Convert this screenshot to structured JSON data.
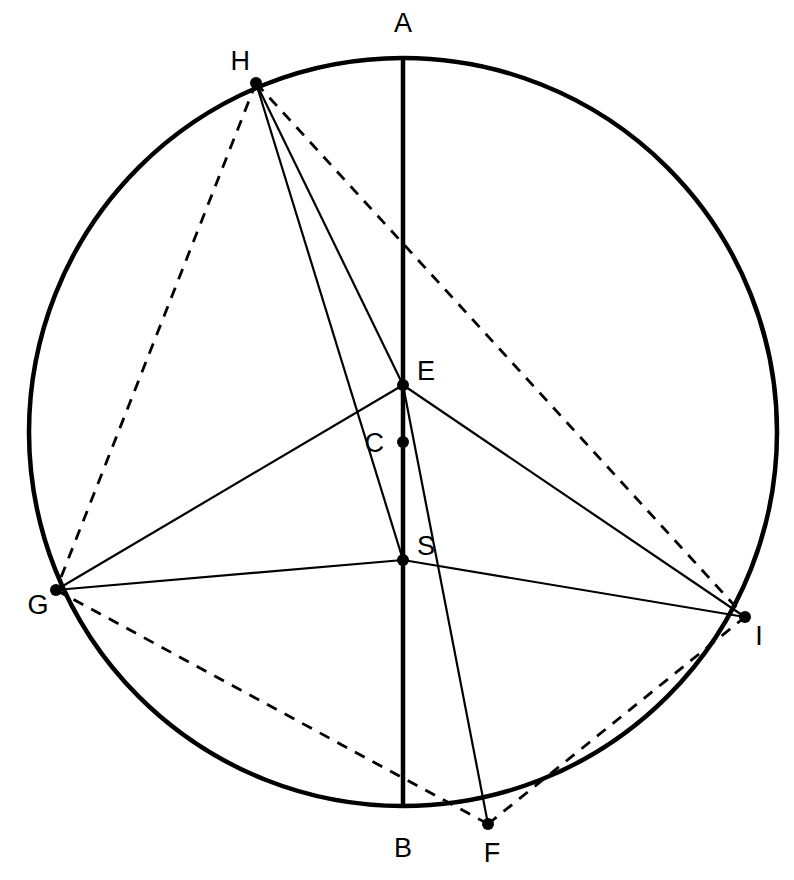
{
  "figure": {
    "background_color": "#ffffff",
    "stroke_color": "#000000",
    "width": 794,
    "height": 880
  },
  "circle": {
    "name": "main-circle",
    "center": {
      "x": 403,
      "y": 432
    },
    "radius": 374,
    "stroke_width": 4.5
  },
  "points": [
    {
      "id": "A",
      "label": "A",
      "x": 403,
      "y": 58,
      "label_x": 403,
      "label_y": 32,
      "dot": false,
      "anchor": "middle"
    },
    {
      "id": "B",
      "label": "B",
      "x": 403,
      "y": 806,
      "label_x": 403,
      "label_y": 857,
      "dot": false,
      "anchor": "middle"
    },
    {
      "id": "C",
      "label": "C",
      "x": 403,
      "y": 442,
      "label_x": 384,
      "label_y": 452,
      "dot": true,
      "anchor": "end"
    },
    {
      "id": "E",
      "label": "E",
      "x": 403,
      "y": 385,
      "label_x": 417,
      "label_y": 380,
      "dot": true,
      "anchor": "start"
    },
    {
      "id": "S",
      "label": "S",
      "x": 403,
      "y": 560,
      "label_x": 417,
      "label_y": 555,
      "dot": true,
      "anchor": "start"
    },
    {
      "id": "F",
      "label": "F",
      "x": 488,
      "y": 824,
      "label_x": 492,
      "label_y": 862,
      "dot": true,
      "anchor": "middle"
    },
    {
      "id": "G",
      "label": "G",
      "x": 56,
      "y": 590,
      "label_x": 38,
      "label_y": 614,
      "dot": true,
      "anchor": "middle"
    },
    {
      "id": "H",
      "label": "H",
      "x": 256,
      "y": 83,
      "label_x": 250,
      "label_y": 70,
      "dot": true,
      "anchor": "end"
    },
    {
      "id": "I",
      "label": "I",
      "x": 745,
      "y": 617,
      "label_x": 759,
      "label_y": 645,
      "dot": true,
      "anchor": "middle"
    }
  ],
  "segments": [
    {
      "name": "diameter-A-B",
      "from": "A",
      "to": "B",
      "style": "solid",
      "stroke_width": 4.5
    },
    {
      "name": "chord-H-E",
      "from": "H",
      "to": "E",
      "style": "solid",
      "stroke_width": 2.2
    },
    {
      "name": "chord-H-S",
      "from": "H",
      "to": "S",
      "style": "solid",
      "stroke_width": 2.2
    },
    {
      "name": "chord-E-F",
      "from": "E",
      "to": "F",
      "style": "solid",
      "stroke_width": 2.2
    },
    {
      "name": "chord-E-G",
      "from": "E",
      "to": "G",
      "style": "solid",
      "stroke_width": 2.2
    },
    {
      "name": "chord-E-I",
      "from": "E",
      "to": "I",
      "style": "solid",
      "stroke_width": 2.2
    },
    {
      "name": "chord-G-S",
      "from": "G",
      "to": "S",
      "style": "solid",
      "stroke_width": 2.2
    },
    {
      "name": "chord-S-I",
      "from": "S",
      "to": "I",
      "style": "solid",
      "stroke_width": 2.2
    },
    {
      "name": "chord-H-G",
      "from": "H",
      "to": "G",
      "style": "dashed",
      "stroke_width": 2.8
    },
    {
      "name": "chord-H-I",
      "from": "H",
      "to": "I",
      "style": "dashed",
      "stroke_width": 2.8
    },
    {
      "name": "chord-G-F",
      "from": "G",
      "to": "F",
      "style": "dashed",
      "stroke_width": 2.8
    },
    {
      "name": "chord-F-I",
      "from": "F",
      "to": "I",
      "style": "dashed",
      "stroke_width": 2.8
    }
  ],
  "style": {
    "dash_pattern": "11 9",
    "dot_radius": 6
  }
}
